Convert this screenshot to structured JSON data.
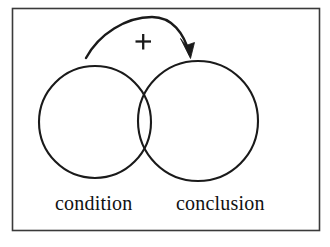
{
  "figure": {
    "kind": "venn-overlap-diagram",
    "background_color": "#ffffff",
    "ink_color": "#1a1a1a",
    "frame": {
      "name": "outer-frame",
      "x": 12,
      "y": 8,
      "width": 308,
      "height": 223,
      "stroke_color": "#3a3a3a",
      "stroke_width": 1.6
    },
    "circles": [
      {
        "name": "condition-circle",
        "label": "condition",
        "cx": 95,
        "cy": 122,
        "r": 56,
        "stroke_color": "#1a1a1a",
        "stroke_width": 2.1,
        "fill": "none"
      },
      {
        "name": "conclusion-circle",
        "label": "conclusion",
        "cx": 198,
        "cy": 121,
        "r": 60,
        "stroke_color": "#1a1a1a",
        "stroke_width": 2.1,
        "fill": "none"
      }
    ],
    "arrow": {
      "name": "influence-arrow",
      "direction": "left-to-right",
      "from": "condition",
      "to": "conclusion",
      "start_x": 86,
      "start_y": 58,
      "apex_x": 150,
      "apex_y": 16,
      "tip_x": 190,
      "tip_y": 57,
      "stroke_color": "#1a1a1a",
      "stroke_width": 2.4
    },
    "sign": {
      "name": "plus-sign",
      "text": "+",
      "x": 143,
      "y": 42,
      "color": "#1a1a1a"
    },
    "labels": {
      "left": "condition",
      "right": "conclusion"
    }
  }
}
